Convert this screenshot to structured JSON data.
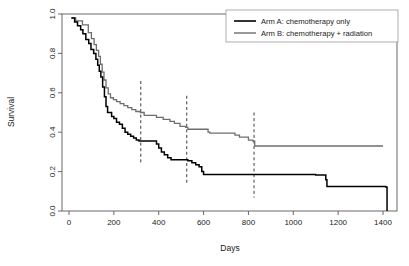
{
  "chart_data": {
    "type": "line",
    "subtype": "kaplan-meier-step",
    "title": "",
    "xlabel": "Days",
    "ylabel": "Survival",
    "xlim": [
      0,
      1400
    ],
    "ylim": [
      0.0,
      1.0
    ],
    "grid": false,
    "legend_position": "top-right",
    "x_ticks": [
      0,
      200,
      400,
      600,
      800,
      1000,
      1200,
      1400
    ],
    "x_tick_labels": [
      "0",
      "200",
      "400",
      "600",
      "800",
      "1000",
      "1200",
      "1400"
    ],
    "y_ticks": [
      0.0,
      0.2,
      0.4,
      0.6,
      0.8,
      1.0
    ],
    "y_tick_labels": [
      "0.0",
      "0.2",
      "0.4",
      "0.6",
      "0.8",
      "1.0"
    ],
    "series": [
      {
        "name": "Arm A: chemotherapy only",
        "color": "#000000",
        "style": "step",
        "x": [
          10,
          25,
          38,
          52,
          62,
          75,
          88,
          98,
          110,
          120,
          128,
          135,
          142,
          150,
          158,
          165,
          172,
          180,
          190,
          200,
          212,
          225,
          238,
          250,
          262,
          275,
          288,
          300,
          312,
          325,
          345,
          368,
          390,
          400,
          412,
          425,
          440,
          455,
          470,
          490,
          510,
          530,
          548,
          565,
          580,
          592,
          600,
          700,
          800,
          900,
          1000,
          1090,
          1100,
          1145,
          1150,
          1300,
          1412,
          1418
        ],
        "y": [
          0.98,
          0.96,
          0.94,
          0.92,
          0.9,
          0.87,
          0.85,
          0.82,
          0.8,
          0.77,
          0.74,
          0.71,
          0.68,
          0.63,
          0.58,
          0.53,
          0.5,
          0.5,
          0.48,
          0.47,
          0.45,
          0.44,
          0.42,
          0.4,
          0.39,
          0.38,
          0.37,
          0.36,
          0.355,
          0.355,
          0.355,
          0.355,
          0.34,
          0.32,
          0.3,
          0.285,
          0.27,
          0.26,
          0.26,
          0.26,
          0.26,
          0.255,
          0.245,
          0.235,
          0.225,
          0.2,
          0.185,
          0.185,
          0.185,
          0.185,
          0.185,
          0.185,
          0.183,
          0.158,
          0.125,
          0.125,
          0.122,
          0.0
        ]
      },
      {
        "name": "Arm B: chemotherapy + radiation",
        "color": "#6e6e6e",
        "style": "step",
        "x": [
          12,
          30,
          46,
          60,
          72,
          86,
          100,
          112,
          122,
          132,
          140,
          148,
          156,
          165,
          175,
          185,
          198,
          212,
          228,
          245,
          262,
          280,
          298,
          318,
          335,
          345,
          390,
          420,
          450,
          470,
          495,
          520,
          530,
          545,
          600,
          620,
          628,
          700,
          740,
          760,
          800,
          820,
          828,
          900,
          1000,
          1100,
          1200,
          1300,
          1400
        ],
        "y": [
          0.98,
          0.965,
          0.965,
          0.945,
          0.945,
          0.905,
          0.875,
          0.845,
          0.815,
          0.785,
          0.745,
          0.705,
          0.665,
          0.625,
          0.595,
          0.575,
          0.565,
          0.555,
          0.545,
          0.535,
          0.525,
          0.515,
          0.505,
          0.5,
          0.485,
          0.485,
          0.475,
          0.465,
          0.455,
          0.445,
          0.43,
          0.425,
          0.415,
          0.415,
          0.415,
          0.4,
          0.395,
          0.395,
          0.385,
          0.375,
          0.36,
          0.355,
          0.33,
          0.33,
          0.33,
          0.33,
          0.33,
          0.33,
          0.33
        ]
      }
    ],
    "reference_lines": [
      {
        "x": 320,
        "y_top": 0.66,
        "y_bottom": 0.24,
        "style": "dashed"
      },
      {
        "x": 525,
        "y_top": 0.585,
        "y_bottom": 0.135,
        "style": "dashed"
      },
      {
        "x": 825,
        "y_top": 0.5,
        "y_bottom": 0.068,
        "style": "dashed"
      }
    ],
    "annotations": []
  },
  "axes": {
    "x_title": "Days",
    "y_title": "Survival"
  },
  "legend": {
    "entries": [
      {
        "label": "Arm A: chemotherapy only",
        "color": "#000000"
      },
      {
        "label": "Arm B: chemotherapy + radiation",
        "color": "#6e6e6e"
      }
    ]
  }
}
